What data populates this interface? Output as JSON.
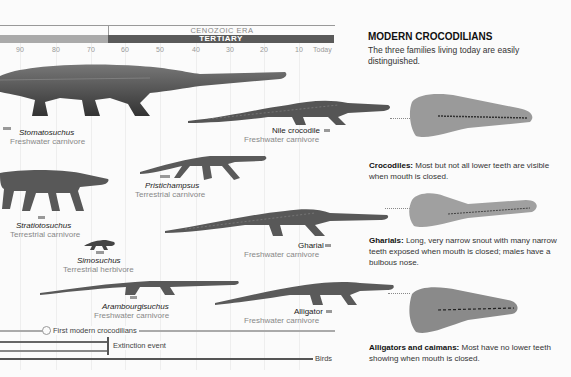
{
  "timeline": {
    "era_label": "CENOZOIC ERA",
    "period_label": "TERTIARY",
    "ticks": [
      "90",
      "80",
      "70",
      "60",
      "50",
      "40",
      "30",
      "20",
      "10",
      "Today"
    ]
  },
  "species": [
    {
      "name": "Stomatosuchus",
      "description": "Freshwater carnivore"
    },
    {
      "name": "Nile crocodile",
      "description": "Freshwater carnivore"
    },
    {
      "name": "Pristichampsus",
      "description": "Terrestrial carnivore"
    },
    {
      "name": "Stratiotosuchus",
      "description": "Terrestrial carnivore"
    },
    {
      "name": "Simosuchus",
      "description": "Terrestrial herbivore"
    },
    {
      "name": "Gharial",
      "description": "Freshwater carnivore"
    },
    {
      "name": "Arambourgisuchus",
      "description": "Freshwater carnivore"
    },
    {
      "name": "Alligator",
      "description": "Freshwater carnivore"
    }
  ],
  "legend": {
    "first_modern": "First modern crocodilians",
    "extinction": "Extinction event",
    "birds": "Birds"
  },
  "sidebar": {
    "title": "MODERN CROCODILIANS",
    "intro": "The three families living today are easily distinguished.",
    "families": [
      {
        "label": "Crocodiles:",
        "text": "Most but not all lower teeth are visible when mouth is closed."
      },
      {
        "label": "Gharials:",
        "text": "Long, very narrow snout with many narrow teeth exposed when mouth is closed; males have a bulbous nose."
      },
      {
        "label": "Alligators and caimans:",
        "text": "Most have no lower teeth showing when mouth is closed."
      }
    ]
  },
  "colors": {
    "tertiary_bar": "#5a5a5a",
    "mesozoic_bar": "#aaaaaa",
    "first_modern_line": "#aaaaaa",
    "extinct_line": "#666666",
    "birds_line": "#555555"
  }
}
